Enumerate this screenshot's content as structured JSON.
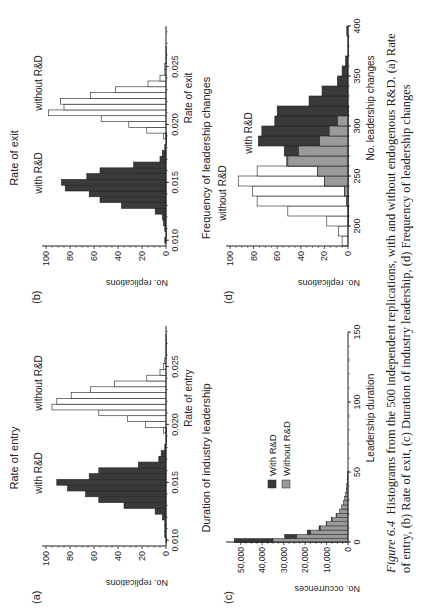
{
  "figure": {
    "number": "Figure 6.4",
    "caption": "Histograms from the 500 independent replications, with and without endogenous R&D. (a) Rate of entry, (b) Rate of exit, (c) Duration of industry leadership, (d) Frequency of leadership changes"
  },
  "panels": {
    "a": {
      "label": "(a)",
      "title": "Rate of entry",
      "xlabel": "Rate of entry",
      "ylabel": "No. replications",
      "ann_with": "with R&D",
      "ann_without": "without R&D"
    },
    "b": {
      "label": "(b)",
      "title": "Rate of exit",
      "xlabel": "Rate of exit",
      "ylabel": "No. replications",
      "ann_with": "with R&D",
      "ann_without": "without R&D"
    },
    "c": {
      "label": "(c)",
      "title": "Duration of industry leadership",
      "xlabel": "Leadership duration",
      "ylabel": "No. occurrences",
      "legend_with": "With R&D",
      "legend_without": "Without R&D"
    },
    "d": {
      "label": "(d)",
      "title": "Frequency of leadership changes",
      "xlabel": "No. leadership changes",
      "ylabel": "No. replications",
      "ann_with": "with R&D",
      "ann_without": "without R&D"
    }
  },
  "chart_data": [
    {
      "type": "bar",
      "title": "Rate of entry",
      "xlabel": "Rate of entry",
      "ylabel": "No. replications",
      "xlim": [
        0.0095,
        0.0285
      ],
      "ylim": [
        0,
        100
      ],
      "xticks": [
        0.01,
        0.015,
        0.02,
        0.025
      ],
      "yticks": [
        0,
        20,
        40,
        60,
        80,
        100
      ],
      "bin_width": 0.0005,
      "series": [
        {
          "name": "with R&D",
          "color": "#3a3a3a",
          "x": [
            0.01,
            0.0105,
            0.011,
            0.0115,
            0.012,
            0.0125,
            0.013,
            0.0135,
            0.014,
            0.0145,
            0.015,
            0.0155,
            0.016,
            0.0165,
            0.017,
            0.0175,
            0.018,
            0.0185,
            0.019,
            0.0195
          ],
          "values": [
            0,
            1,
            1,
            1,
            3,
            9,
            35,
            56,
            67,
            82,
            91,
            64,
            56,
            23,
            6,
            4,
            1,
            0,
            0,
            0
          ]
        },
        {
          "name": "without R&D",
          "color": "#ffffff",
          "x": [
            0.0195,
            0.02,
            0.0205,
            0.021,
            0.0215,
            0.022,
            0.0225,
            0.023,
            0.0235,
            0.024,
            0.0245,
            0.025,
            0.0255,
            0.026,
            0.0265,
            0.027,
            0.0275
          ],
          "values": [
            2,
            17,
            32,
            56,
            95,
            91,
            79,
            63,
            43,
            16,
            5,
            2,
            1,
            0,
            0,
            0,
            0
          ]
        }
      ]
    },
    {
      "type": "bar",
      "title": "Rate of exit",
      "xlabel": "Rate of exit",
      "ylabel": "No. replications",
      "xlim": [
        0.0095,
        0.0285
      ],
      "ylim": [
        0,
        100
      ],
      "xticks": [
        0.01,
        0.015,
        0.02,
        0.025
      ],
      "yticks": [
        0,
        20,
        40,
        60,
        80,
        100
      ],
      "bin_width": 0.0005,
      "series": [
        {
          "name": "with R&D",
          "color": "#3a3a3a",
          "x": [
            0.01,
            0.0105,
            0.011,
            0.0115,
            0.012,
            0.0125,
            0.013,
            0.0135,
            0.014,
            0.0145,
            0.015,
            0.0155,
            0.016,
            0.0165,
            0.017,
            0.0175,
            0.018,
            0.0185,
            0.019
          ],
          "values": [
            1,
            0,
            1,
            2,
            3,
            9,
            37,
            55,
            64,
            84,
            87,
            66,
            55,
            27,
            5,
            3,
            1,
            0,
            0
          ]
        },
        {
          "name": "without R&D",
          "color": "#ffffff",
          "x": [
            0.019,
            0.0195,
            0.02,
            0.0205,
            0.021,
            0.0215,
            0.022,
            0.0225,
            0.023,
            0.0235,
            0.024,
            0.0245,
            0.025,
            0.0255,
            0.026,
            0.0265
          ],
          "values": [
            2,
            16,
            31,
            54,
            98,
            85,
            88,
            63,
            42,
            15,
            5,
            1,
            1,
            0,
            0,
            0
          ]
        }
      ]
    },
    {
      "type": "bar",
      "title": "Duration of industry leadership",
      "xlabel": "Leadership duration",
      "ylabel": "No. occurrences",
      "xlim": [
        0,
        150
      ],
      "ylim": [
        0,
        55000
      ],
      "xticks": [
        0,
        50,
        100,
        150
      ],
      "yticks": [
        0,
        10000,
        20000,
        30000,
        40000,
        50000
      ],
      "ytick_labels": [
        "0",
        "10,000",
        "20,000",
        "30,000",
        "40,000",
        "50,000"
      ],
      "bin_width": 3,
      "stacked": true,
      "legend_position": "upper-middle",
      "series": [
        {
          "name": "Without R&D",
          "color": "#9a9a9a",
          "x": [
            1,
            4,
            7,
            10,
            13,
            16,
            19,
            22,
            25,
            28,
            31,
            34,
            37,
            40,
            43,
            46,
            49
          ],
          "values": [
            35000,
            24000,
            17500,
            13000,
            10000,
            7500,
            5500,
            4000,
            3000,
            2200,
            1600,
            1200,
            800,
            600,
            400,
            300,
            200
          ]
        },
        {
          "name": "With R&D",
          "color": "#3a3a3a",
          "x": [
            1,
            4,
            7,
            10,
            13,
            16,
            19,
            22,
            25,
            28,
            31,
            34,
            37,
            40,
            43,
            46,
            49
          ],
          "values": [
            18000,
            5500,
            1500,
            500,
            200,
            100,
            50,
            0,
            0,
            0,
            0,
            0,
            0,
            0,
            0,
            0,
            0
          ]
        }
      ]
    },
    {
      "type": "bar",
      "title": "Frequency of leadership changes",
      "xlabel": "No. leadership changes",
      "ylabel": "No. replications",
      "xlim": [
        180,
        400
      ],
      "ylim": [
        0,
        100
      ],
      "xticks": [
        200,
        250,
        300,
        350,
        400
      ],
      "yticks": [
        0,
        20,
        40,
        60,
        80,
        100
      ],
      "bin_width": 10,
      "series": [
        {
          "name": "without R&D",
          "color": "#ffffff",
          "x": [
            185,
            195,
            205,
            215,
            225,
            235,
            245,
            255,
            265,
            275,
            285,
            295,
            305
          ],
          "values": [
            5,
            8,
            18,
            51,
            77,
            81,
            93,
            77,
            52,
            44,
            24,
            16,
            9
          ]
        },
        {
          "name": "with R&D",
          "color": "#3a3a3a",
          "x": [
            205,
            215,
            225,
            235,
            245,
            255,
            265,
            275,
            285,
            295,
            305,
            315,
            325,
            335,
            345,
            355,
            365,
            375,
            385,
            395
          ],
          "values": [
            0,
            0,
            1,
            3,
            20,
            26,
            51,
            54,
            76,
            73,
            62,
            60,
            33,
            22,
            9,
            5,
            2,
            0,
            0,
            1
          ]
        },
        {
          "name": "overlap",
          "color": "#9a9a9a",
          "x": [
            225,
            235,
            245,
            255,
            265,
            275,
            285,
            295,
            305,
            315
          ],
          "values": [
            1,
            3,
            20,
            26,
            51,
            42,
            24,
            16,
            9,
            0
          ]
        }
      ]
    }
  ]
}
